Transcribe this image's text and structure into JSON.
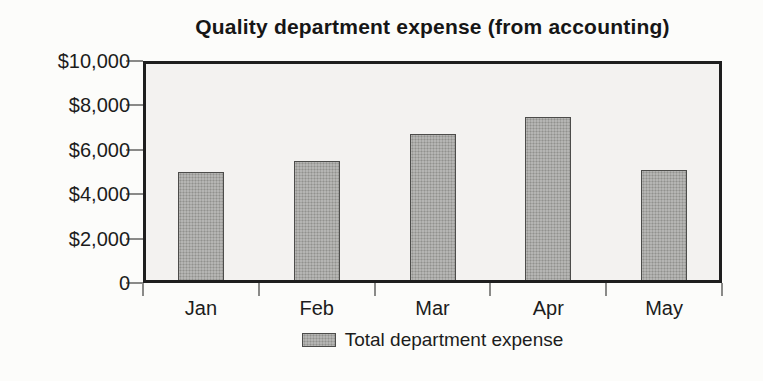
{
  "page": {
    "background_color": "#fcfcfa",
    "text_color": "#1c1c1c"
  },
  "chart_data": {
    "type": "bar",
    "title": "Quality department expense (from accounting)",
    "categories": [
      "Jan",
      "Feb",
      "Mar",
      "Apr",
      "May"
    ],
    "series": [
      {
        "name": "Total department expense",
        "values": [
          5000,
          5500,
          6700,
          7500,
          5100
        ]
      }
    ],
    "xlabel": "",
    "ylabel": "",
    "ylim": [
      0,
      10000
    ],
    "y_tick_step": 2000,
    "y_tick_labels": [
      "0",
      "$2,000",
      "$4,000",
      "$6,000",
      "$8,000",
      "$10,000"
    ],
    "grid": false,
    "legend_position": "bottom",
    "bar_fill_color": "#b5b5b3",
    "bar_dot_color": "#91918e",
    "bar_border_color": "#4c4c4a",
    "plot_background_color": "#f3f2f0",
    "plot_border_color": "#1e1e1e",
    "tick_color": "#8a8a88"
  },
  "legend": {
    "label": "Total department expense"
  }
}
